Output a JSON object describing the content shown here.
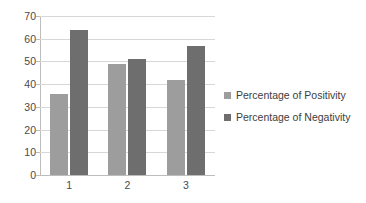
{
  "chart_data": {
    "type": "bar",
    "title": "",
    "subtitle": "",
    "xlabel": "",
    "ylabel": "",
    "categories": [
      "1",
      "2",
      "3"
    ],
    "series": [
      {
        "name": "Percentage of Positivity",
        "color": "#9d9d9d",
        "values": [
          35.5,
          49,
          42
        ]
      },
      {
        "name": "Percentage of Negativity",
        "color": "#6e6e6e",
        "values": [
          64,
          51,
          57
        ]
      }
    ],
    "ylim": [
      0,
      70
    ],
    "ytick_step": 10,
    "ytick_labels": [
      "0",
      "10",
      "20",
      "30",
      "40",
      "50",
      "60",
      "70"
    ],
    "grid": true,
    "grid_axis": "y",
    "legend_position": "right",
    "background_color": "#ffffff",
    "axis_color": "#bdbdbd",
    "gridline_color": "#d7d7d7",
    "tick_text_color": "#4a4a4a"
  },
  "legend": {
    "items": [
      {
        "label": "Percentage of Positivity",
        "swatch": "legend-swatch-positivity"
      },
      {
        "label": "Percentage of Negativity",
        "swatch": "legend-swatch-negativity"
      }
    ]
  }
}
